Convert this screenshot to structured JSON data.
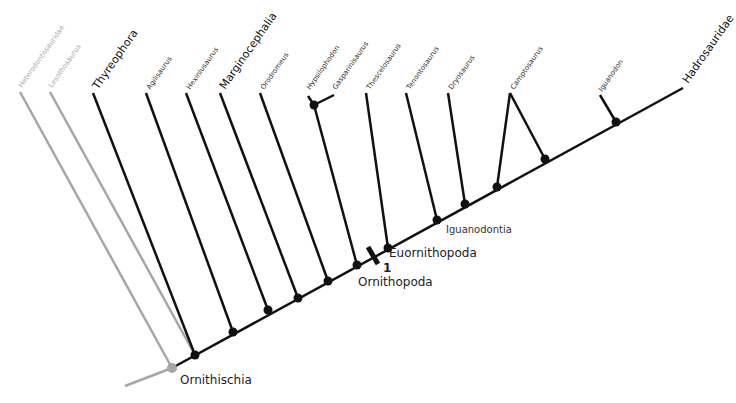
{
  "diagram": {
    "type": "cladogram",
    "root_label": "Ornithischia",
    "colors": {
      "main": "#111111",
      "outgroup": "#a6a6a6"
    },
    "taxa": [
      {
        "label": "Heterodontosauridae",
        "style": "small-gray"
      },
      {
        "label": "Lesothosaurus",
        "style": "small-gray"
      },
      {
        "label": "Thyreophora",
        "style": "big"
      },
      {
        "label": "Agilisaurus",
        "style": "small"
      },
      {
        "label": "Hexinlusaurus",
        "style": "small"
      },
      {
        "label": "Marginocephalia",
        "style": "big"
      },
      {
        "label": "Orodromeus",
        "style": "small"
      },
      {
        "label": "Hypsilophodon",
        "style": "small"
      },
      {
        "label": "Gasparinisaurus",
        "style": "small"
      },
      {
        "label": "Thescelosaurus",
        "style": "small"
      },
      {
        "label": "Tenontosaurus",
        "style": "small"
      },
      {
        "label": "Dryosaurus",
        "style": "small"
      },
      {
        "label": "Camptosaurus",
        "style": "small"
      },
      {
        "label": "Iguanodon",
        "style": "small"
      },
      {
        "label": "Hadrosauridae",
        "style": "big"
      }
    ],
    "clade_labels": {
      "ornithischia": "Ornithischia",
      "ornithopoda": "Ornithopoda",
      "euornithopoda": "Euornithopoda",
      "iguanodontia": "Iguanodontia",
      "marker": "1"
    }
  }
}
